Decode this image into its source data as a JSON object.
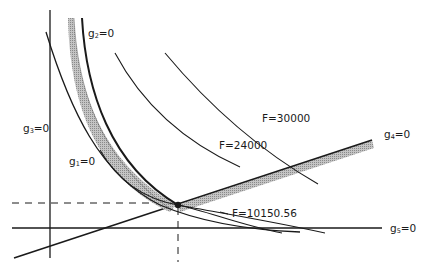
{
  "diagram": {
    "type": "optimization-feasible-region",
    "constraints": [
      {
        "id": "g1",
        "name": "g",
        "sub": "1",
        "rhs": "=0"
      },
      {
        "id": "g2",
        "name": "g",
        "sub": "2",
        "rhs": "=0"
      },
      {
        "id": "g3",
        "name": "g",
        "sub": "3",
        "rhs": "=0"
      },
      {
        "id": "g4",
        "name": "g",
        "sub": "4",
        "rhs": "=0"
      },
      {
        "id": "g5",
        "name": "g",
        "sub": "5",
        "rhs": "=0"
      }
    ],
    "objective_contours": [
      {
        "label": "F=30000"
      },
      {
        "label": "F=24000"
      },
      {
        "label": "F=10150.56"
      }
    ],
    "optimum_point": "optimum",
    "colors": {
      "line": "#1a1a1a",
      "hatch": "#a8a8a8",
      "background": "#ffffff"
    }
  }
}
